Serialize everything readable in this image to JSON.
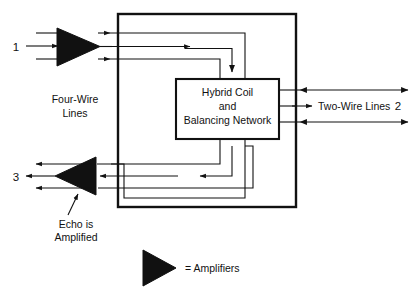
{
  "diagram": {
    "type": "block-diagram",
    "colors": {
      "line": "#111111",
      "fill_amplifier": "#111111",
      "background": "#ffffff"
    },
    "blocks": [
      {
        "name": "outer-enclosure",
        "label": "",
        "x": 118,
        "y": 14,
        "width": 178,
        "height": 193,
        "stroke_width": 2.2
      },
      {
        "name": "hybrid-coil-block",
        "label_lines": [
          "Hybrid Coil",
          "and",
          "Balancing Network"
        ],
        "x": 176,
        "y": 79,
        "width": 103,
        "height": 60,
        "stroke_width": 2.0
      }
    ],
    "labels": {
      "hybrid_line1": "Hybrid Coil",
      "hybrid_line2": "and",
      "hybrid_line3": "Balancing Network",
      "four_wire_line1": "Four-Wire",
      "four_wire_line2": "Lines",
      "two_wire": "Two-Wire Lines",
      "echo_line1": "Echo is",
      "echo_line2": "Amplified",
      "legend": "= Amplifiers",
      "port_1": "1",
      "port_2": "2",
      "port_3": "3"
    },
    "amplifiers": [
      {
        "name": "input-amplifier",
        "direction": "right",
        "x": 55,
        "y": 28,
        "width": 45,
        "height": 38
      },
      {
        "name": "output-amplifier",
        "direction": "left",
        "x": 55,
        "y": 157,
        "width": 42,
        "height": 38
      },
      {
        "name": "legend-amplifier",
        "direction": "right",
        "x": 143,
        "y": 250,
        "width": 33,
        "height": 36
      }
    ],
    "ports": [
      {
        "name": "port-1-four-wire-in",
        "label": "1",
        "x": 16,
        "y": 50
      },
      {
        "name": "port-2-two-wire",
        "label": "2",
        "x": 404,
        "y": 108
      },
      {
        "name": "port-3-four-wire-out",
        "label": "3",
        "x": 16,
        "y": 180
      }
    ]
  }
}
